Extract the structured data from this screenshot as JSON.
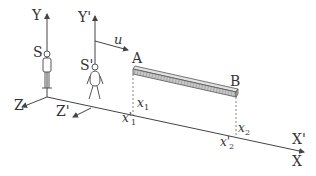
{
  "diagram": {
    "axes": {
      "Y": "Y",
      "Y_prime": "Y'",
      "Z": "Z",
      "Z_prime": "Z'",
      "X": "X",
      "X_prime": "X'"
    },
    "observers": {
      "S": "S",
      "S_prime": "S'"
    },
    "velocity_label": "u",
    "rod": {
      "end_a": "A",
      "end_b": "B"
    },
    "positions": {
      "x1": "x",
      "x1_sub": "1",
      "x1_prime": "x'",
      "x1_prime_sub": "1",
      "x2": "x",
      "x2_sub": "2",
      "x2_prime": "x'",
      "x2_prime_sub": "2"
    },
    "colors": {
      "line": "#444444",
      "rod_fill": "#bdbdbd",
      "rod_hatch": "#777777",
      "text": "#333333"
    }
  }
}
